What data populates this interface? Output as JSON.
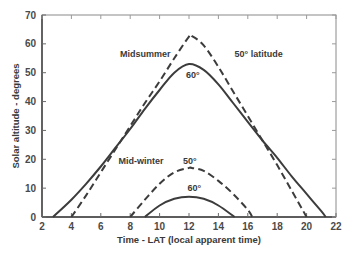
{
  "chart_data": {
    "type": "line",
    "title": "",
    "xlabel": "Time - LAT (local apparent time)",
    "ylabel": "Solar altitude - degrees",
    "xlim": [
      2,
      22
    ],
    "ylim": [
      0,
      70
    ],
    "xticks": [
      2,
      4,
      6,
      8,
      10,
      12,
      14,
      16,
      18,
      20,
      22
    ],
    "yticks": [
      0,
      10,
      20,
      30,
      40,
      50,
      60,
      70
    ],
    "grid": false,
    "legend": "none (inline annotations)",
    "series": [
      {
        "name": "Midsummer 50° latitude",
        "style": "dashed",
        "sunrise": 4.0,
        "sunset": 20.0,
        "peak_time": 12.2,
        "peak_altitude": 62.7,
        "x": [
          4.0,
          5,
          6,
          7,
          8,
          9,
          10,
          11,
          12,
          12.2,
          13,
          14,
          15,
          16,
          17,
          18,
          19,
          20.0
        ],
        "y": [
          0,
          7.5,
          15.5,
          23.5,
          31.5,
          39.5,
          47,
          55,
          62.5,
          62.7,
          59.5,
          52,
          43.5,
          35,
          26.5,
          18,
          9,
          0
        ]
      },
      {
        "name": "Midsummer 60° latitude",
        "style": "solid",
        "sunrise": 2.75,
        "sunset": 21.3,
        "peak_time": 12.0,
        "peak_altitude": 53.0,
        "x": [
          2.75,
          3,
          4,
          5,
          6,
          7,
          8,
          9,
          10,
          11,
          12,
          13,
          14,
          15,
          16,
          17,
          18,
          19,
          20,
          21,
          21.3
        ],
        "y": [
          0,
          1.2,
          6,
          11.5,
          17.5,
          24,
          30.5,
          37.5,
          44,
          50,
          53,
          51,
          46,
          39.5,
          33,
          26.5,
          20.5,
          14,
          8,
          2,
          0
        ]
      },
      {
        "name": "Mid-winter 50° latitude",
        "style": "dashed",
        "sunrise": 8.0,
        "sunset": 16.3,
        "peak_time": 12.2,
        "peak_altitude": 17.0,
        "x": [
          8.0,
          9,
          10,
          11,
          12,
          12.2,
          13,
          14,
          15,
          16,
          16.3
        ],
        "y": [
          0,
          6,
          11.5,
          15.5,
          17,
          17,
          16,
          12.5,
          8,
          2.5,
          0
        ]
      },
      {
        "name": "Mid-winter 60° latitude",
        "style": "solid",
        "sunrise": 9.0,
        "sunset": 15.1,
        "peak_time": 12.0,
        "peak_altitude": 7.0,
        "x": [
          9.0,
          10,
          11,
          12,
          13,
          14,
          15.1
        ],
        "y": [
          0,
          4,
          6.3,
          7,
          6.3,
          4,
          0
        ]
      }
    ],
    "annotations": [
      {
        "text": "Midsummer",
        "x": 7.3,
        "y": 55.5
      },
      {
        "text": "50° latitude",
        "x": 15.1,
        "y": 55.5
      },
      {
        "text": "60°",
        "x": 11.8,
        "y": 48
      },
      {
        "text": "Mid-winter",
        "x": 7.2,
        "y": 18.5
      },
      {
        "text": "50°",
        "x": 11.6,
        "y": 18.5
      },
      {
        "text": "60°",
        "x": 11.9,
        "y": 9
      }
    ]
  },
  "labels": {
    "xlabel": "Time - LAT (local apparent time)",
    "ylabel": "Solar altitude - degrees",
    "midsummer": "Midsummer",
    "lat50": "50° latitude",
    "summer60": "60°",
    "midwinter": "Mid-winter",
    "winter50": "50°",
    "winter60": "60°"
  }
}
